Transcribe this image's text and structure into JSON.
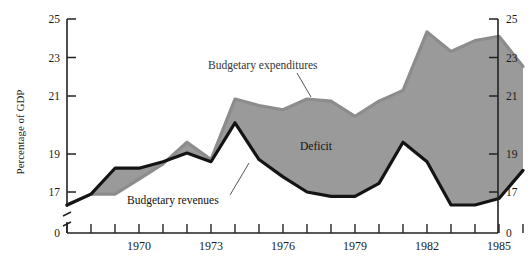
{
  "chart_data": {
    "type": "line",
    "title": "",
    "subtitle": "",
    "xlabel": "",
    "ylabel": "Percentage of GDP",
    "ylim": [
      17,
      25
    ],
    "yticks": [
      17,
      19,
      21,
      23,
      25
    ],
    "ytick_labels": [
      "17",
      "19",
      "21",
      "23",
      "25"
    ],
    "y_break_label": "0",
    "y_axis_right": true,
    "grid": false,
    "legend_position": "inline-annotations",
    "x": [
      1967,
      1968,
      1969,
      1970,
      1971,
      1972,
      1973,
      1974,
      1975,
      1976,
      1977,
      1978,
      1979,
      1980,
      1981,
      1982,
      1983,
      1984,
      1985,
      1986
    ],
    "xticks": [
      1967,
      1968,
      1969,
      1970,
      1971,
      1972,
      1973,
      1974,
      1975,
      1976,
      1977,
      1978,
      1979,
      1980,
      1981,
      1982,
      1983,
      1984,
      1985,
      1986
    ],
    "xtick_labels": [
      "",
      "",
      "",
      "1970",
      "",
      "",
      "1973",
      "",
      "",
      "1976",
      "",
      "",
      "1979",
      "",
      "",
      "1982",
      "",
      "",
      "1985",
      ""
    ],
    "xtick_labels_shown": [
      "1970",
      "1973",
      "1976",
      "1979",
      "1982",
      "1985"
    ],
    "series": [
      {
        "name": "Budgetary expenditures",
        "color": "#8c8c8c",
        "values": [
          16.4,
          16.9,
          16.9,
          17.6,
          18.3,
          19.3,
          18.5,
          21.3,
          21.0,
          20.8,
          21.3,
          21.2,
          20.5,
          21.2,
          21.7,
          24.4,
          23.5,
          24.0,
          24.2,
          22.8
        ]
      },
      {
        "name": "Budgetary revenues",
        "color": "#141414",
        "values": [
          16.4,
          16.9,
          18.1,
          18.1,
          18.4,
          18.8,
          18.4,
          20.2,
          18.5,
          17.7,
          17.0,
          16.8,
          16.8,
          17.4,
          19.3,
          18.4,
          16.4,
          16.4,
          16.7,
          18.0
        ]
      }
    ],
    "fill_between": {
      "name": "Deficit",
      "color": "#9a9a9a",
      "upper_series": "Budgetary expenditures",
      "lower_series": "Budgetary revenues"
    },
    "annotations": [
      {
        "name": "expenditures-label",
        "text": "Budgetary expenditures",
        "x": 208,
        "y": 69,
        "leader_to_x": 296,
        "leader_to_y": 95
      },
      {
        "name": "revenues-label",
        "text": "Budgetary revenues",
        "x": 127,
        "y": 204,
        "leader_to_x": 250,
        "leader_to_y": 173
      },
      {
        "name": "deficit-label",
        "text": "Deficit",
        "x": 300,
        "y": 150
      }
    ]
  },
  "axis": {
    "y_title": "Percentage of GDP",
    "y_ticks": [
      "25",
      "23",
      "21",
      "19",
      "17"
    ],
    "y_zero": "0",
    "x_years": [
      "1970",
      "1973",
      "1976",
      "1979",
      "1982",
      "1985"
    ]
  },
  "labels": {
    "expenditures": "Budgetary expenditures",
    "revenues": "Budgetary revenues",
    "deficit": "Deficit"
  },
  "colors": {
    "expenditure_line": "#8c8c8c",
    "revenue_line": "#141414",
    "deficit_fill": "#9a9a9a",
    "axis": "#222222",
    "background": "#ffffff"
  }
}
